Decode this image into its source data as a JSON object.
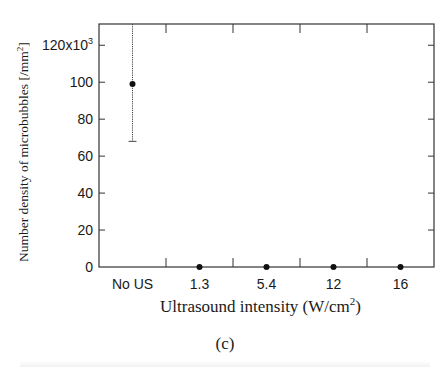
{
  "chart_data": {
    "type": "scatter",
    "title": "",
    "panel_label": "(c)",
    "xlabel": "Ultrasound intensity (W/cm",
    "xlabel_sup": "2",
    "xlabel_end": ")",
    "ylabel": "Number density of microbubbles [/mm",
    "ylabel_sup": "2",
    "ylabel_end": "]",
    "categories": [
      "No US",
      "1.3",
      "5.4",
      "12",
      "16"
    ],
    "values": [
      99,
      0,
      0,
      0,
      0
    ],
    "error_low": [
      68,
      0,
      0,
      0,
      0
    ],
    "error_high": [
      131.5,
      0,
      0,
      0,
      0
    ],
    "y_multiplier": "x10^3",
    "ylim": [
      0,
      131.5
    ],
    "yticks": [
      0,
      20,
      40,
      60,
      80,
      100,
      120
    ],
    "ytick_labels": [
      "0",
      "20",
      "40",
      "60",
      "80",
      "100",
      "120x10"
    ],
    "ytick_top_sup": "3",
    "grid": false,
    "legend": null
  }
}
